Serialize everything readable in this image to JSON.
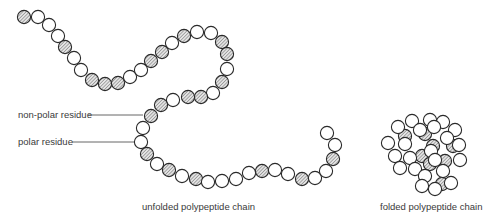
{
  "figure": {
    "labels": {
      "non_polar": "non-polar residue",
      "polar": "polar residue",
      "unfolded": "unfolded polypeptide chain",
      "folded": "folded polypeptide chain"
    },
    "colors": {
      "stroke": "#2a2a2a",
      "polar_fill": "#ffffff",
      "nonpolar_fill": "#d9d9d9",
      "hatch": "#555555",
      "text": "#3a3a3a",
      "leader": "#555555"
    },
    "bead_radius": 6.6,
    "unfolded_chain": [
      {
        "x": 24,
        "y": 17,
        "t": "n"
      },
      {
        "x": 38,
        "y": 17,
        "t": "p"
      },
      {
        "x": 49,
        "y": 25,
        "t": "p"
      },
      {
        "x": 58,
        "y": 36,
        "t": "p"
      },
      {
        "x": 65,
        "y": 47,
        "t": "n"
      },
      {
        "x": 74,
        "y": 58,
        "t": "p"
      },
      {
        "x": 81,
        "y": 70,
        "t": "p"
      },
      {
        "x": 92,
        "y": 80,
        "t": "n"
      },
      {
        "x": 105,
        "y": 84,
        "t": "n"
      },
      {
        "x": 118,
        "y": 83,
        "t": "n"
      },
      {
        "x": 130,
        "y": 77,
        "t": "p"
      },
      {
        "x": 141,
        "y": 70,
        "t": "p"
      },
      {
        "x": 151,
        "y": 61,
        "t": "n"
      },
      {
        "x": 162,
        "y": 52,
        "t": "n"
      },
      {
        "x": 172,
        "y": 43,
        "t": "p"
      },
      {
        "x": 184,
        "y": 36,
        "t": "n"
      },
      {
        "x": 197,
        "y": 32,
        "t": "p"
      },
      {
        "x": 211,
        "y": 33,
        "t": "p"
      },
      {
        "x": 222,
        "y": 42,
        "t": "n"
      },
      {
        "x": 227,
        "y": 54,
        "t": "n"
      },
      {
        "x": 227,
        "y": 69,
        "t": "p"
      },
      {
        "x": 222,
        "y": 82,
        "t": "n"
      },
      {
        "x": 213,
        "y": 93,
        "t": "p"
      },
      {
        "x": 201,
        "y": 97,
        "t": "n"
      },
      {
        "x": 188,
        "y": 97,
        "t": "n"
      },
      {
        "x": 173,
        "y": 100,
        "t": "p"
      },
      {
        "x": 161,
        "y": 105,
        "t": "n"
      },
      {
        "x": 151,
        "y": 116,
        "t": "n"
      },
      {
        "x": 143,
        "y": 128,
        "t": "p"
      },
      {
        "x": 141,
        "y": 142,
        "t": "p"
      },
      {
        "x": 147,
        "y": 154,
        "t": "n"
      },
      {
        "x": 157,
        "y": 164,
        "t": "p"
      },
      {
        "x": 169,
        "y": 170,
        "t": "n"
      },
      {
        "x": 182,
        "y": 176,
        "t": "p"
      },
      {
        "x": 196,
        "y": 179,
        "t": "n"
      },
      {
        "x": 208,
        "y": 182,
        "t": "p"
      },
      {
        "x": 222,
        "y": 181,
        "t": "p"
      },
      {
        "x": 236,
        "y": 179,
        "t": "p"
      },
      {
        "x": 249,
        "y": 173,
        "t": "p"
      },
      {
        "x": 262,
        "y": 171,
        "t": "n"
      },
      {
        "x": 275,
        "y": 170,
        "t": "p"
      },
      {
        "x": 288,
        "y": 174,
        "t": "p"
      },
      {
        "x": 302,
        "y": 179,
        "t": "n"
      },
      {
        "x": 315,
        "y": 178,
        "t": "p"
      },
      {
        "x": 326,
        "y": 171,
        "t": "p"
      },
      {
        "x": 333,
        "y": 159,
        "t": "n"
      },
      {
        "x": 335,
        "y": 145,
        "t": "p"
      },
      {
        "x": 327,
        "y": 133,
        "t": "p"
      }
    ],
    "folded_chain": [
      {
        "x": 405,
        "y": 136,
        "t": "n"
      },
      {
        "x": 425,
        "y": 134,
        "t": "n"
      },
      {
        "x": 422,
        "y": 156,
        "t": "n"
      },
      {
        "x": 433,
        "y": 146,
        "t": "n"
      },
      {
        "x": 453,
        "y": 146,
        "t": "n"
      },
      {
        "x": 445,
        "y": 161,
        "t": "n"
      },
      {
        "x": 442,
        "y": 184,
        "t": "n"
      },
      {
        "x": 430,
        "y": 164,
        "t": "n"
      },
      {
        "x": 398,
        "y": 127,
        "t": "p"
      },
      {
        "x": 412,
        "y": 121,
        "t": "p"
      },
      {
        "x": 430,
        "y": 120,
        "t": "p"
      },
      {
        "x": 443,
        "y": 122,
        "t": "p"
      },
      {
        "x": 455,
        "y": 130,
        "t": "p"
      },
      {
        "x": 388,
        "y": 143,
        "t": "p"
      },
      {
        "x": 405,
        "y": 144,
        "t": "p"
      },
      {
        "x": 420,
        "y": 130,
        "t": "p"
      },
      {
        "x": 434,
        "y": 127,
        "t": "p"
      },
      {
        "x": 447,
        "y": 138,
        "t": "p"
      },
      {
        "x": 459,
        "y": 145,
        "t": "p"
      },
      {
        "x": 395,
        "y": 156,
        "t": "p"
      },
      {
        "x": 410,
        "y": 158,
        "t": "p"
      },
      {
        "x": 431,
        "y": 151,
        "t": "p"
      },
      {
        "x": 460,
        "y": 160,
        "t": "p"
      },
      {
        "x": 400,
        "y": 168,
        "t": "p"
      },
      {
        "x": 415,
        "y": 169,
        "t": "p"
      },
      {
        "x": 435,
        "y": 160,
        "t": "p"
      },
      {
        "x": 443,
        "y": 171,
        "t": "p"
      },
      {
        "x": 425,
        "y": 176,
        "t": "p"
      },
      {
        "x": 422,
        "y": 186,
        "t": "p"
      },
      {
        "x": 435,
        "y": 189,
        "t": "p"
      },
      {
        "x": 451,
        "y": 183,
        "t": "p"
      }
    ],
    "leaders": [
      {
        "name": "non-polar-leader",
        "x1": 88,
        "y1": 115,
        "x2": 143,
        "y2": 115
      },
      {
        "name": "polar-leader",
        "x1": 72,
        "y1": 142,
        "x2": 135,
        "y2": 142
      }
    ]
  }
}
